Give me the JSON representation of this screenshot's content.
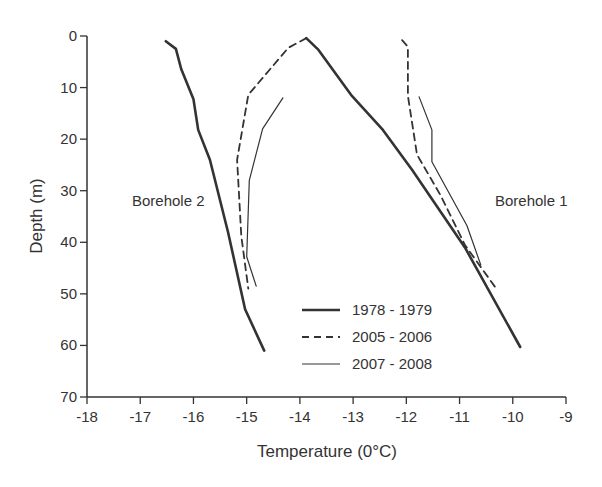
{
  "chart_data": {
    "type": "line",
    "title": "",
    "xlabel": "Temperature (0°C)",
    "ylabel": "Depth (m)",
    "xlim": [
      -18,
      -9
    ],
    "ylim": [
      70,
      0
    ],
    "y_inverted": true,
    "x_ticks": [
      -18,
      -17,
      -16,
      -15,
      -14,
      -13,
      -12,
      -11,
      -10,
      -9
    ],
    "x_tick_labels": [
      "-18",
      "-17",
      "-16",
      "-15",
      "-14",
      "-13",
      "-12",
      "-11",
      "-10",
      "-9"
    ],
    "y_ticks": [
      0,
      10,
      20,
      30,
      40,
      50,
      60,
      70
    ],
    "y_tick_labels": [
      "0",
      "10",
      "20",
      "30",
      "40",
      "50",
      "60",
      "70"
    ],
    "grid": false,
    "legend_position": "lower center (inside plot)",
    "legend": [
      {
        "label": "1978 - 1979",
        "style": "solid-thick"
      },
      {
        "label": "2005 - 2006",
        "style": "dashed"
      },
      {
        "label": "2007 - 2008",
        "style": "solid-thin"
      }
    ],
    "annotations": [
      {
        "text": "Borehole 2",
        "x": -17.1,
        "y": 32
      },
      {
        "text": "Borehole 1",
        "x": -10.8,
        "y": 32
      }
    ],
    "series": [
      {
        "name": "1978 - 1979",
        "group": "Borehole 2",
        "style": "solid-thick",
        "points": [
          [
            -16.52,
            1
          ],
          [
            -16.33,
            2.5
          ],
          [
            -16.23,
            6.4
          ],
          [
            -16.0,
            12.2
          ],
          [
            -15.91,
            18.2
          ],
          [
            -15.69,
            24
          ],
          [
            -15.35,
            38
          ],
          [
            -15.03,
            53
          ],
          [
            -14.67,
            61
          ]
        ]
      },
      {
        "name": "2005 - 2006",
        "group": "Borehole 2",
        "style": "dashed",
        "points": [
          [
            -13.88,
            0.4
          ],
          [
            -14.22,
            2.3
          ],
          [
            -14.97,
            11.4
          ],
          [
            -15.18,
            24
          ],
          [
            -15.1,
            38.8
          ],
          [
            -14.97,
            49
          ]
        ]
      },
      {
        "name": "2007 - 2008",
        "group": "Borehole 2",
        "style": "solid-thin",
        "points": [
          [
            -14.32,
            12
          ],
          [
            -14.7,
            18
          ],
          [
            -14.95,
            28
          ],
          [
            -15.0,
            42.8
          ],
          [
            -14.82,
            48.5
          ]
        ]
      },
      {
        "name": "1978 - 1979",
        "group": "Borehole 1",
        "style": "solid-thick",
        "points": [
          [
            -13.88,
            0.4
          ],
          [
            -13.65,
            2.7
          ],
          [
            -13.04,
            11.4
          ],
          [
            -12.44,
            18.2
          ],
          [
            -11.89,
            26
          ],
          [
            -10.9,
            41
          ],
          [
            -9.86,
            60.3
          ]
        ]
      },
      {
        "name": "2005 - 2006",
        "group": "Borehole 1",
        "style": "dashed",
        "points": [
          [
            -12.08,
            0.8
          ],
          [
            -11.97,
            2.1
          ],
          [
            -11.97,
            11.6
          ],
          [
            -11.8,
            23
          ],
          [
            -11.35,
            31
          ],
          [
            -10.9,
            40.5
          ],
          [
            -10.31,
            49
          ]
        ]
      },
      {
        "name": "2007 - 2008",
        "group": "Borehole 1",
        "style": "solid-thin",
        "points": [
          [
            -11.76,
            11.8
          ],
          [
            -11.52,
            18.2
          ],
          [
            -11.52,
            24.4
          ],
          [
            -10.86,
            36.8
          ],
          [
            -10.6,
            44.4
          ]
        ]
      }
    ]
  },
  "colors": {
    "ink": "#333333",
    "background": "#ffffff"
  }
}
